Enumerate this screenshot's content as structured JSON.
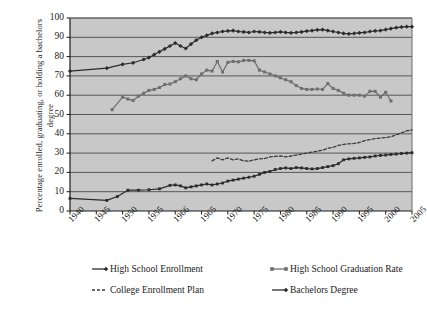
{
  "chart_data": {
    "type": "line",
    "title": "",
    "xlabel": "",
    "ylabel": "Percentage enrolled, graduating, or holding a bachelors degree",
    "xlim": [
      1940,
      2005
    ],
    "ylim": [
      0,
      100
    ],
    "yticks": [
      0,
      10,
      20,
      30,
      40,
      50,
      60,
      70,
      80,
      90,
      100
    ],
    "xticks": [
      "1940",
      "1945",
      "1950",
      "1955",
      "1966",
      "1965",
      "1970",
      "1975",
      "1980",
      "1985",
      "1990",
      "1995",
      "2000",
      "2005"
    ],
    "xtick_values": [
      1940,
      1945,
      1950,
      1955,
      1960,
      1965,
      1970,
      1975,
      1980,
      1985,
      1990,
      1995,
      2000,
      2005
    ],
    "grid": "horizontal",
    "plot_background": "#c8c8c8",
    "legend_position": "bottom",
    "series": [
      {
        "name": "High School Enrollment",
        "color": "#2b2b2b",
        "marker": "diamond",
        "dash": "solid",
        "points": [
          [
            1940,
            72.5
          ],
          [
            1947,
            74.0
          ],
          [
            1950,
            76.0
          ],
          [
            1952,
            76.8
          ],
          [
            1954,
            78.5
          ],
          [
            1955,
            79.5
          ],
          [
            1956,
            81.0
          ],
          [
            1957,
            82.5
          ],
          [
            1958,
            84.0
          ],
          [
            1959,
            85.5
          ],
          [
            1960,
            87.0
          ],
          [
            1961,
            85.5
          ],
          [
            1962,
            84.2
          ],
          [
            1963,
            86.5
          ],
          [
            1964,
            88.5
          ],
          [
            1965,
            90.0
          ],
          [
            1966,
            91.0
          ],
          [
            1967,
            92.0
          ],
          [
            1968,
            92.5
          ],
          [
            1969,
            93.0
          ],
          [
            1970,
            93.3
          ],
          [
            1971,
            93.5
          ],
          [
            1972,
            93.0
          ],
          [
            1973,
            92.8
          ],
          [
            1974,
            92.5
          ],
          [
            1975,
            93.0
          ],
          [
            1976,
            92.8
          ],
          [
            1977,
            92.5
          ],
          [
            1978,
            92.3
          ],
          [
            1979,
            92.5
          ],
          [
            1980,
            92.8
          ],
          [
            1981,
            92.5
          ],
          [
            1982,
            92.3
          ],
          [
            1983,
            92.5
          ],
          [
            1984,
            92.8
          ],
          [
            1985,
            93.2
          ],
          [
            1986,
            93.5
          ],
          [
            1987,
            93.8
          ],
          [
            1988,
            94.0
          ],
          [
            1989,
            93.5
          ],
          [
            1990,
            93.0
          ],
          [
            1991,
            92.5
          ],
          [
            1992,
            92.0
          ],
          [
            1993,
            91.8
          ],
          [
            1994,
            92.0
          ],
          [
            1995,
            92.3
          ],
          [
            1996,
            92.5
          ],
          [
            1997,
            93.0
          ],
          [
            1998,
            93.3
          ],
          [
            1999,
            93.5
          ],
          [
            2000,
            94.0
          ],
          [
            2001,
            94.5
          ],
          [
            2002,
            95.0
          ],
          [
            2003,
            95.3
          ],
          [
            2004,
            95.5
          ],
          [
            2005,
            95.5
          ]
        ]
      },
      {
        "name": "High School Graduation Rate",
        "color": "#6e6e6e",
        "marker": "square",
        "dash": "solid",
        "points": [
          [
            1948,
            52.5
          ],
          [
            1950,
            59.0
          ],
          [
            1951,
            58.0
          ],
          [
            1952,
            57.3
          ],
          [
            1953,
            59.5
          ],
          [
            1954,
            61.0
          ],
          [
            1955,
            62.5
          ],
          [
            1956,
            63.0
          ],
          [
            1957,
            64.0
          ],
          [
            1958,
            65.5
          ],
          [
            1959,
            65.8
          ],
          [
            1960,
            67.0
          ],
          [
            1961,
            68.5
          ],
          [
            1962,
            70.0
          ],
          [
            1963,
            68.5
          ],
          [
            1964,
            68.0
          ],
          [
            1965,
            71.0
          ],
          [
            1966,
            73.0
          ],
          [
            1967,
            72.5
          ],
          [
            1968,
            77.5
          ],
          [
            1969,
            72.0
          ],
          [
            1970,
            77.0
          ],
          [
            1971,
            77.5
          ],
          [
            1972,
            77.3
          ],
          [
            1973,
            78.0
          ],
          [
            1974,
            78.0
          ],
          [
            1975,
            77.8
          ],
          [
            1976,
            73.0
          ],
          [
            1977,
            72.0
          ],
          [
            1978,
            71.0
          ],
          [
            1979,
            70.0
          ],
          [
            1980,
            69.0
          ],
          [
            1981,
            68.0
          ],
          [
            1982,
            67.0
          ],
          [
            1983,
            65.0
          ],
          [
            1984,
            63.5
          ],
          [
            1985,
            63.0
          ],
          [
            1986,
            63.0
          ],
          [
            1987,
            63.2
          ],
          [
            1988,
            63.0
          ],
          [
            1989,
            66.0
          ],
          [
            1990,
            63.5
          ],
          [
            1991,
            62.5
          ],
          [
            1992,
            61.0
          ],
          [
            1993,
            60.0
          ],
          [
            1994,
            60.0
          ],
          [
            1995,
            60.0
          ],
          [
            1996,
            59.5
          ],
          [
            1997,
            62.0
          ],
          [
            1998,
            62.0
          ],
          [
            1999,
            59.0
          ],
          [
            2000,
            61.5
          ],
          [
            2001,
            57.0
          ]
        ]
      },
      {
        "name": "College Enrollment Plan",
        "color": "#3a3a3a",
        "marker": "none",
        "dash": "dashed",
        "points": [
          [
            1967,
            26.0
          ],
          [
            1968,
            27.5
          ],
          [
            1969,
            26.5
          ],
          [
            1970,
            27.5
          ],
          [
            1971,
            26.5
          ],
          [
            1972,
            27.0
          ],
          [
            1973,
            26.0
          ],
          [
            1974,
            25.8
          ],
          [
            1975,
            26.5
          ],
          [
            1976,
            27.0
          ],
          [
            1977,
            27.2
          ],
          [
            1978,
            28.0
          ],
          [
            1979,
            28.3
          ],
          [
            1980,
            28.5
          ],
          [
            1981,
            28.0
          ],
          [
            1982,
            28.5
          ],
          [
            1983,
            29.0
          ],
          [
            1984,
            29.5
          ],
          [
            1985,
            30.0
          ],
          [
            1986,
            30.5
          ],
          [
            1987,
            31.0
          ],
          [
            1988,
            31.5
          ],
          [
            1989,
            32.5
          ],
          [
            1990,
            33.0
          ],
          [
            1991,
            34.0
          ],
          [
            1992,
            34.5
          ],
          [
            1993,
            34.8
          ],
          [
            1994,
            35.0
          ],
          [
            1995,
            35.5
          ],
          [
            1996,
            36.5
          ],
          [
            1997,
            37.0
          ],
          [
            1998,
            37.5
          ],
          [
            1999,
            37.8
          ],
          [
            2000,
            38.0
          ],
          [
            2001,
            38.5
          ],
          [
            2002,
            39.5
          ],
          [
            2003,
            40.5
          ],
          [
            2004,
            41.5
          ],
          [
            2005,
            42.0
          ]
        ]
      },
      {
        "name": "Bachelors Degree",
        "color": "#2b2b2b",
        "marker": "cross",
        "dash": "solid",
        "points": [
          [
            1940,
            6.5
          ],
          [
            1947,
            5.5
          ],
          [
            1949,
            7.5
          ],
          [
            1951,
            10.8
          ],
          [
            1953,
            10.8
          ],
          [
            1955,
            11.0
          ],
          [
            1957,
            11.5
          ],
          [
            1959,
            13.3
          ],
          [
            1960,
            13.5
          ],
          [
            1961,
            13.0
          ],
          [
            1962,
            12.0
          ],
          [
            1963,
            12.5
          ],
          [
            1964,
            13.0
          ],
          [
            1965,
            13.5
          ],
          [
            1966,
            14.0
          ],
          [
            1967,
            13.5
          ],
          [
            1968,
            14.0
          ],
          [
            1969,
            14.5
          ],
          [
            1970,
            15.5
          ],
          [
            1971,
            16.0
          ],
          [
            1972,
            16.5
          ],
          [
            1973,
            17.0
          ],
          [
            1974,
            17.5
          ],
          [
            1975,
            18.0
          ],
          [
            1976,
            19.0
          ],
          [
            1977,
            20.0
          ],
          [
            1978,
            20.5
          ],
          [
            1979,
            21.5
          ],
          [
            1980,
            22.0
          ],
          [
            1981,
            22.3
          ],
          [
            1982,
            22.0
          ],
          [
            1983,
            22.5
          ],
          [
            1984,
            22.3
          ],
          [
            1985,
            22.0
          ],
          [
            1986,
            21.8
          ],
          [
            1987,
            22.0
          ],
          [
            1988,
            22.5
          ],
          [
            1989,
            23.0
          ],
          [
            1990,
            23.5
          ],
          [
            1991,
            24.5
          ],
          [
            1992,
            26.5
          ],
          [
            1993,
            27.0
          ],
          [
            1994,
            27.3
          ],
          [
            1995,
            27.5
          ],
          [
            1996,
            27.8
          ],
          [
            1997,
            28.0
          ],
          [
            1998,
            28.5
          ],
          [
            1999,
            28.8
          ],
          [
            2000,
            29.0
          ],
          [
            2001,
            29.3
          ],
          [
            2002,
            29.5
          ],
          [
            2003,
            29.8
          ],
          [
            2004,
            30.0
          ],
          [
            2005,
            30.2
          ]
        ]
      }
    ]
  },
  "legend": {
    "items": [
      {
        "label": "High School Enrollment"
      },
      {
        "label": "High School Graduation Rate"
      },
      {
        "label": "College Enrollment Plan"
      },
      {
        "label": "Bachelors Degree"
      }
    ]
  }
}
